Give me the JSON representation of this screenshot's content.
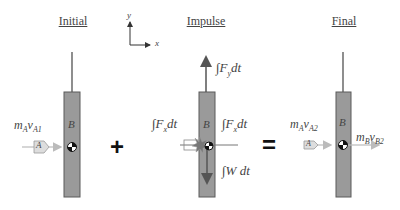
{
  "titles": {
    "initial": "Initial",
    "impulse": "Impulse",
    "final": "Final"
  },
  "axes": {
    "x_label": "x",
    "y_label": "y"
  },
  "initial": {
    "body_label": "B",
    "particle_label": "A",
    "momentum_A": {
      "m": "m",
      "m_sub": "A",
      "v": "v",
      "v_sub": "A1"
    }
  },
  "impulse": {
    "body_label": "B",
    "particle_label": "A",
    "fy": {
      "int": "∫",
      "F": "F",
      "sub": "y",
      "dt": "dt"
    },
    "fx_left": {
      "int": "∫",
      "F": "F",
      "sub": "x",
      "dt": "dt"
    },
    "fx_right": {
      "int": "∫",
      "F": "F",
      "sub": "x",
      "dt": "dt"
    },
    "w": {
      "int": "∫",
      "W": "W",
      "dt": "dt"
    }
  },
  "final": {
    "body_label": "B",
    "particle_label": "A",
    "momentum_A": {
      "m": "m",
      "m_sub": "A",
      "v": "v",
      "v_sub": "A2"
    },
    "momentum_B": {
      "m": "m",
      "m_sub": "B",
      "v": "v",
      "v_sub": "B2"
    }
  },
  "operators": {
    "plus": "+",
    "equals": "="
  },
  "colors": {
    "bar_fill": "#9a9a9a",
    "bar_stroke": "#5a5a5a",
    "arrow_light": "#b8b8b8",
    "arrow_dark": "#555555",
    "rod": "#444444"
  }
}
